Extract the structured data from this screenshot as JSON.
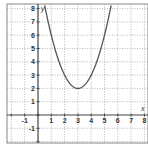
{
  "chart_data": {
    "type": "line",
    "title": "",
    "xlabel": "x",
    "ylabel": "y",
    "xlim": [
      -2.3,
      8.3
    ],
    "ylim": [
      -2.1,
      8.3
    ],
    "grid": true,
    "grid_style": "dotted",
    "x_ticks": [
      -1,
      1,
      2,
      3,
      4,
      5,
      6,
      7,
      8
    ],
    "y_ticks": [
      -1,
      1,
      2,
      3,
      4,
      5,
      6,
      7,
      8
    ],
    "x_tick_labels": [
      "-1",
      "1",
      "2",
      "3",
      "4",
      "5",
      "6",
      "7",
      "8"
    ],
    "y_tick_labels": [
      "-1",
      "1",
      "2",
      "3",
      "4",
      "5",
      "6",
      "7",
      "8"
    ],
    "series": [
      {
        "name": "parabola",
        "equation": "y = (x - 3)^2 + 2",
        "vertex": [
          3,
          2
        ],
        "x": [
          0.55,
          1,
          1.5,
          2,
          2.5,
          3,
          3.5,
          4,
          4.5,
          5,
          5.45
        ],
        "y": [
          8,
          6,
          4.25,
          3,
          2.25,
          2,
          2.25,
          3,
          4.25,
          6,
          8
        ]
      }
    ],
    "colors": {
      "curve": "#555555",
      "axes": "#444444",
      "grid": "#9a9a9a",
      "frame": "#888888"
    }
  },
  "labels": {
    "x_axis_letter": "x",
    "y_axis_letter": "y"
  }
}
